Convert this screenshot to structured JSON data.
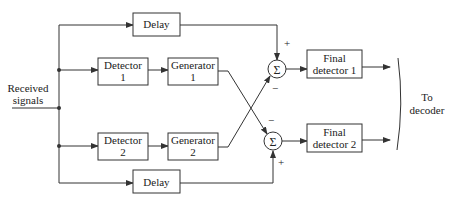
{
  "input": {
    "label_line1": "Received",
    "label_line2": "signals"
  },
  "blocks": {
    "delay_top": {
      "label": "Delay"
    },
    "detector1": {
      "line1": "Detector",
      "line2": "1"
    },
    "generator1": {
      "line1": "Generator",
      "line2": "1"
    },
    "detector2": {
      "line1": "Detector",
      "line2": "2"
    },
    "generator2": {
      "line1": "Generator",
      "line2": "2"
    },
    "delay_bottom": {
      "label": "Delay"
    },
    "final1": {
      "line1": "Final",
      "line2": "detector 1"
    },
    "final2": {
      "line1": "Final",
      "line2": "detector 2"
    }
  },
  "summers": {
    "sum1": {
      "symbol": "Σ",
      "plus": "+",
      "minus": "−"
    },
    "sum2": {
      "symbol": "Σ",
      "plus": "+",
      "minus": "−"
    }
  },
  "output": {
    "label_line1": "To",
    "label_line2": "decoder"
  },
  "colors": {
    "line": "#333333",
    "text": "#222222",
    "background": "#ffffff"
  }
}
